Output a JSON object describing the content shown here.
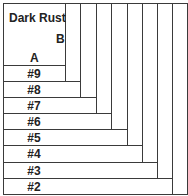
{
  "diagram": {
    "title": "Dark Rust",
    "corner_labels": {
      "a": "A",
      "b": "B"
    },
    "rows": [
      {
        "label": "#9",
        "top": 65,
        "right": 65
      },
      {
        "label": "#8",
        "top": 81,
        "right": 80
      },
      {
        "label": "#7",
        "top": 97,
        "right": 96
      },
      {
        "label": "#6",
        "top": 113,
        "right": 111
      },
      {
        "label": "#5",
        "top": 129,
        "right": 127
      },
      {
        "label": "#4",
        "top": 145,
        "right": 142
      },
      {
        "label": "#3",
        "top": 162,
        "right": 157
      },
      {
        "label": "#2",
        "top": 178,
        "right": 172
      }
    ],
    "line_color": "#3a3a3a"
  }
}
